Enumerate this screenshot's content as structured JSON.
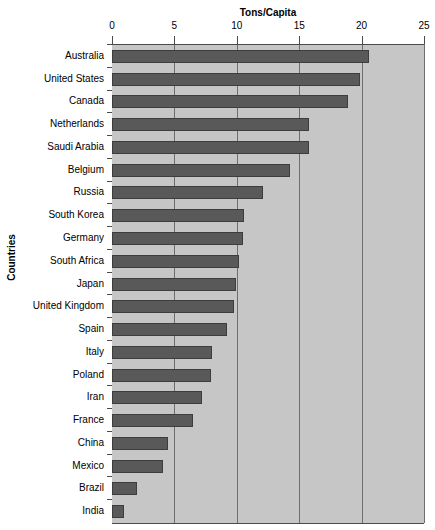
{
  "chart_data": {
    "type": "bar",
    "orientation": "horizontal",
    "title": "",
    "xlabel": "Tons/Capita",
    "ylabel": "Countries",
    "xlim": [
      0,
      25
    ],
    "xticks": [
      0,
      5,
      10,
      15,
      20,
      25
    ],
    "xtick_labels": [
      "0",
      "5",
      "10",
      "15",
      "20",
      "25"
    ],
    "grid": true,
    "legend": false,
    "bar_color": "#595959",
    "plot_background": "#c6c6c6",
    "categories": [
      "Australia",
      "United States",
      "Canada",
      "Netherlands",
      "Saudi Arabia",
      "Belgium",
      "Russia",
      "South Korea",
      "Germany",
      "South Africa",
      "Japan",
      "United Kingdom",
      "Spain",
      "Italy",
      "Poland",
      "Iran",
      "France",
      "China",
      "Mexico",
      "Brazil",
      "India"
    ],
    "values": [
      20.6,
      19.9,
      18.9,
      15.8,
      15.8,
      14.3,
      12.1,
      10.6,
      10.5,
      10.2,
      9.9,
      9.8,
      9.2,
      8.0,
      7.9,
      7.2,
      6.5,
      4.5,
      4.1,
      2.0,
      1.0
    ]
  }
}
